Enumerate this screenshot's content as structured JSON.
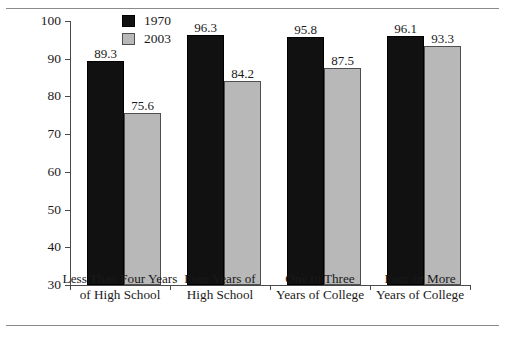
{
  "chart_data": {
    "type": "bar",
    "title": "",
    "xlabel": "",
    "ylabel": "Participation Rate (Percentage)",
    "ylim": [
      30,
      100
    ],
    "yticks": [
      30,
      40,
      50,
      60,
      70,
      80,
      90,
      100
    ],
    "ytick_labels": [
      "30",
      "40",
      "50",
      "60",
      "70",
      "80",
      "90",
      "100"
    ],
    "grid": false,
    "legend_position": "top-center",
    "categories": [
      "Less Than Four Years\nof High School",
      "Four Years of\nHigh School",
      "One to Three\nYears of College",
      "Four or More\nYears of College"
    ],
    "series": [
      {
        "name": "1970",
        "color": "#111111",
        "values": [
          89.3,
          96.3,
          95.8,
          96.1
        ],
        "value_labels": [
          "89.3",
          "96.3",
          "95.8",
          "96.1"
        ]
      },
      {
        "name": "2003",
        "color": "#b8b8b8",
        "values": [
          75.6,
          84.2,
          87.5,
          93.3
        ],
        "value_labels": [
          "75.6",
          "84.2",
          "87.5",
          "93.3"
        ]
      }
    ]
  },
  "legend": {
    "items": [
      {
        "label": "1970",
        "swatch": "dark-swatch-icon"
      },
      {
        "label": "2003",
        "swatch": "light-swatch-icon"
      }
    ]
  }
}
